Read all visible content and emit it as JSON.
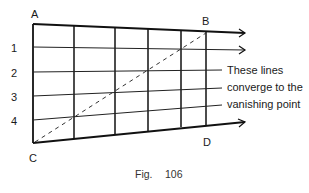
{
  "figure": {
    "points": {
      "A": "A",
      "B": "B",
      "C": "C",
      "D": "D"
    },
    "rows": [
      "1",
      "2",
      "3",
      "4"
    ],
    "annotation": [
      "These lines",
      "converge to the",
      "vanishing point"
    ],
    "caption": {
      "prefix": "Fig.",
      "number": "106"
    }
  }
}
